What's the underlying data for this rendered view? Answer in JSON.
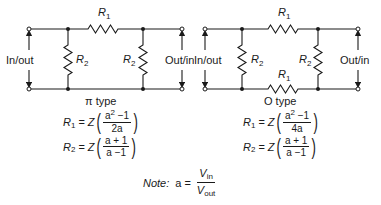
{
  "pi_network": {
    "caption": "π type",
    "series_resistor": {
      "name": "R",
      "sub": "1"
    },
    "shunt_left": {
      "name": "R",
      "sub": "2"
    },
    "shunt_right": {
      "name": "R",
      "sub": "2"
    },
    "port_left": "In/out",
    "port_right": "Out/in",
    "formula_r1": {
      "lhs_name": "R",
      "lhs_sub": "1",
      "eq": "=",
      "Z": "Z",
      "num_base": "a",
      "num_exp": "2",
      "num_rest": " −1",
      "den": "2a"
    },
    "formula_r2": {
      "lhs_name": "R",
      "lhs_sub": "2",
      "eq": "=",
      "Z": "Z",
      "num": "a + 1",
      "den": "a −1"
    }
  },
  "o_network": {
    "caption": "O type",
    "series_top": {
      "name": "R",
      "sub": "1"
    },
    "series_bottom": {
      "name": "R",
      "sub": "1"
    },
    "shunt_left": {
      "name": "R",
      "sub": "2"
    },
    "shunt_right": {
      "name": "R",
      "sub": "2"
    },
    "port_left": "In/out",
    "port_right": "Out/in",
    "formula_r1": {
      "lhs_name": "R",
      "lhs_sub": "1",
      "eq": "=",
      "Z": "Z",
      "num_base": "a",
      "num_exp": "2",
      "num_rest": " −1",
      "den": "4a"
    },
    "formula_r2": {
      "lhs_name": "R",
      "lhs_sub": "2",
      "eq": "=",
      "Z": "Z",
      "num": "a + 1",
      "den": "a −1"
    }
  },
  "note": {
    "label": "Note:",
    "lhs": "a",
    "eq": "=",
    "num_name": "V",
    "num_sub": "in",
    "den_name": "V",
    "den_sub": "out"
  },
  "colors": {
    "line": "#1a1a1a",
    "background": "#ffffff"
  }
}
